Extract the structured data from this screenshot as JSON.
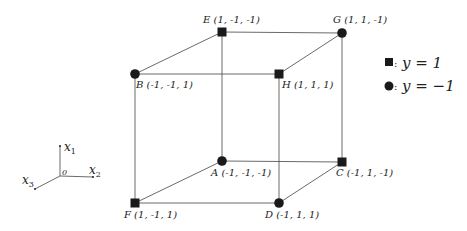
{
  "diagram": {
    "title": "",
    "nodes": [
      {
        "id": "E",
        "label": "E (1, -1, -1)",
        "class": "y=1",
        "marker": "square",
        "x": 222,
        "y": 32
      },
      {
        "id": "G",
        "label": "G (1, 1, -1)",
        "class": "y=-1",
        "marker": "circle",
        "x": 342,
        "y": 33
      },
      {
        "id": "B",
        "label": "B (-1, -1, 1)",
        "class": "y=-1",
        "marker": "circle",
        "x": 135,
        "y": 74
      },
      {
        "id": "H",
        "label": "H (1, 1, 1)",
        "class": "y=1",
        "marker": "square",
        "x": 279,
        "y": 74
      },
      {
        "id": "A",
        "label": "A (-1, -1, -1)",
        "class": "y=-1",
        "marker": "circle",
        "x": 222,
        "y": 161
      },
      {
        "id": "C",
        "label": "C (-1, 1, -1)",
        "class": "y=1",
        "marker": "square",
        "x": 342,
        "y": 162
      },
      {
        "id": "F",
        "label": "F (1, -1, 1)",
        "class": "y=1",
        "marker": "square",
        "x": 135,
        "y": 203
      },
      {
        "id": "D",
        "label": "D (-1, 1, 1)",
        "class": "y=-1",
        "marker": "circle",
        "x": 279,
        "y": 203
      }
    ],
    "edges": [
      [
        "E",
        "G"
      ],
      [
        "B",
        "H"
      ],
      [
        "E",
        "B"
      ],
      [
        "G",
        "H"
      ],
      [
        "A",
        "C"
      ],
      [
        "F",
        "D"
      ],
      [
        "A",
        "F"
      ],
      [
        "C",
        "D"
      ],
      [
        "E",
        "A"
      ],
      [
        "G",
        "C"
      ],
      [
        "B",
        "F"
      ],
      [
        "H",
        "D"
      ]
    ],
    "legend": [
      {
        "marker": "square",
        "text": "y = 1"
      },
      {
        "marker": "circle",
        "text": "y = −1"
      }
    ],
    "axes": {
      "origin_label": "0",
      "x1": "x1",
      "x2": "x2",
      "x3": "x3"
    },
    "labels": {
      "E": "E (1, -1, -1)",
      "G": "G (1, 1, -1)",
      "B": "B (-1, -1, 1)",
      "H": "H (1, 1, 1)",
      "A": "A (-1, -1, -1)",
      "C": "C (-1, 1, -1)",
      "F": "F (1, -1, 1)",
      "D": "D (-1, 1, 1)",
      "legend_sq": "y = 1",
      "legend_ci": "y = −1",
      "legend_sep": ":",
      "origin": "0",
      "x1_main": "x",
      "x1_sub": "1",
      "x2_main": "x",
      "x2_sub": "2",
      "x3_main": "x",
      "x3_sub": "3"
    },
    "colors": {
      "marker": "#1a1a1a",
      "edge": "#444444"
    }
  }
}
